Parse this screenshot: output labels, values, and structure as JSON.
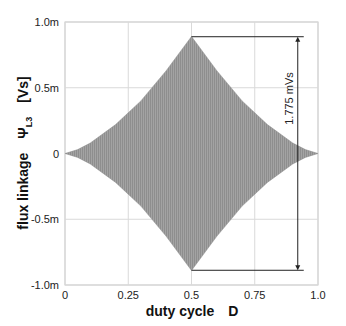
{
  "chart_data": {
    "type": "area",
    "title": "",
    "xlabel": "duty cycle",
    "xlabel_symbol": "D",
    "ylabel": "flux linkage",
    "ylabel_symbol": "Ψ",
    "ylabel_subscript": "L3",
    "ylabel_unit": "[Vs]",
    "xlim": [
      0,
      1.0
    ],
    "ylim": [
      -0.001,
      0.001
    ],
    "x_ticks": [
      0,
      0.25,
      0.5,
      0.75,
      1.0
    ],
    "x_tick_labels": [
      "0",
      "0.25",
      "0.5",
      "0.75",
      "1.0"
    ],
    "y_ticks": [
      0.001,
      0.0005,
      0,
      -0.0005,
      -0.001
    ],
    "y_tick_labels": [
      "1.0m",
      "0.5m",
      "0",
      "-0.5m",
      "-1.0m"
    ],
    "grid": true,
    "legend": null,
    "series": [
      {
        "name": "flux linkage envelope (upper)",
        "x": [
          0,
          0.05,
          0.1,
          0.2,
          0.3,
          0.4,
          0.5,
          0.6,
          0.7,
          0.8,
          0.9,
          0.95,
          1.0
        ],
        "values": [
          0,
          3e-05,
          8e-05,
          0.00022,
          0.0004,
          0.00063,
          0.00089,
          0.00063,
          0.0004,
          0.00022,
          8e-05,
          3e-05,
          0
        ]
      },
      {
        "name": "flux linkage envelope (lower)",
        "x": [
          0,
          0.05,
          0.1,
          0.2,
          0.3,
          0.4,
          0.5,
          0.6,
          0.7,
          0.8,
          0.9,
          0.95,
          1.0
        ],
        "values": [
          0,
          -3e-05,
          -8e-05,
          -0.00022,
          -0.0004,
          -0.00063,
          -0.00089,
          -0.00063,
          -0.0004,
          -0.00022,
          -8e-05,
          -3e-05,
          0
        ]
      }
    ],
    "annotations": [
      {
        "type": "dimension-arrow",
        "text": "1.775 mVs",
        "from": [
          0.5,
          0.000888
        ],
        "to": [
          0.5,
          -0.000888
        ],
        "arrow_x": 0.92
      }
    ],
    "colors": {
      "fill": "#9a9a9a",
      "grid": "#d9d9d9",
      "axis": "#bdbdbd",
      "annotation": "#222222"
    }
  }
}
